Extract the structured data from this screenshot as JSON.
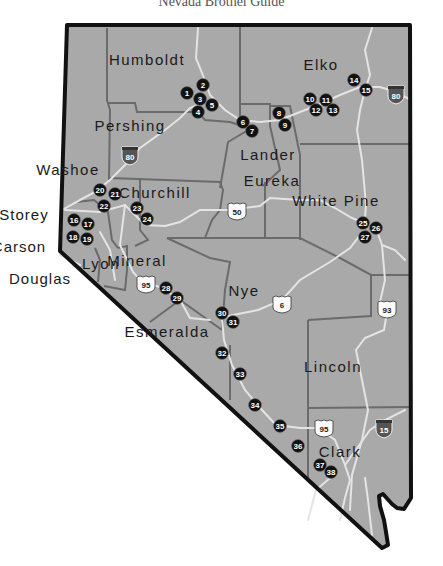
{
  "title": "Nevada Brothel Guide",
  "colors": {
    "land": "#a9a9a9",
    "outline": "#111111",
    "county_border": "#6b6b6b",
    "road": "#e4e4e4",
    "marker": "#111111"
  },
  "counties": [
    {
      "name": "Humboldt",
      "x": 147,
      "y": 65
    },
    {
      "name": "Elko",
      "x": 321,
      "y": 70
    },
    {
      "name": "Pershing",
      "x": 130,
      "y": 131
    },
    {
      "name": "Lander",
      "x": 268,
      "y": 160
    },
    {
      "name": "Washoe",
      "x": 68,
      "y": 175
    },
    {
      "name": "Churchill",
      "x": 155,
      "y": 198
    },
    {
      "name": "Eureka",
      "x": 272,
      "y": 186
    },
    {
      "name": "White Pine",
      "x": 336,
      "y": 206
    },
    {
      "name": "Lyon",
      "x": 101,
      "y": 269
    },
    {
      "name": "Mineral",
      "x": 137,
      "y": 266
    },
    {
      "name": "Nye",
      "x": 244,
      "y": 296
    },
    {
      "name": "Esmeralda",
      "x": 167,
      "y": 337
    },
    {
      "name": "Lincoln",
      "x": 333,
      "y": 372
    },
    {
      "name": "Clark",
      "x": 340,
      "y": 457
    }
  ],
  "external_labels": [
    {
      "name": "Storey",
      "x": 24,
      "y": 220
    },
    {
      "name": "Carson",
      "x": 19,
      "y": 252
    },
    {
      "name": "Douglas",
      "x": 40,
      "y": 284
    }
  ],
  "highways": [
    {
      "type": "interstate",
      "number": "80",
      "x": 130,
      "y": 155
    },
    {
      "type": "interstate",
      "number": "80",
      "x": 396,
      "y": 94
    },
    {
      "type": "us",
      "number": "50",
      "x": 237,
      "y": 211
    },
    {
      "type": "us",
      "number": "95",
      "x": 146,
      "y": 284
    },
    {
      "type": "us",
      "number": "6",
      "x": 282,
      "y": 304
    },
    {
      "type": "us",
      "number": "93",
      "x": 387,
      "y": 309
    },
    {
      "type": "us",
      "number": "95",
      "x": 324,
      "y": 428
    },
    {
      "type": "interstate",
      "number": "15",
      "x": 384,
      "y": 428
    }
  ],
  "markers": [
    {
      "n": "1",
      "x": 187,
      "y": 93
    },
    {
      "n": "2",
      "x": 203,
      "y": 85
    },
    {
      "n": "3",
      "x": 200,
      "y": 99
    },
    {
      "n": "4",
      "x": 198,
      "y": 112
    },
    {
      "n": "5",
      "x": 212,
      "y": 105
    },
    {
      "n": "6",
      "x": 243,
      "y": 122
    },
    {
      "n": "7",
      "x": 252,
      "y": 131
    },
    {
      "n": "8",
      "x": 279,
      "y": 113
    },
    {
      "n": "9",
      "x": 285,
      "y": 125
    },
    {
      "n": "10",
      "x": 310,
      "y": 99
    },
    {
      "n": "11",
      "x": 326,
      "y": 100
    },
    {
      "n": "12",
      "x": 316,
      "y": 110
    },
    {
      "n": "13",
      "x": 333,
      "y": 110
    },
    {
      "n": "14",
      "x": 354,
      "y": 80
    },
    {
      "n": "15",
      "x": 366,
      "y": 90
    },
    {
      "n": "16",
      "x": 74,
      "y": 220
    },
    {
      "n": "17",
      "x": 88,
      "y": 224
    },
    {
      "n": "18",
      "x": 73,
      "y": 237
    },
    {
      "n": "19",
      "x": 87,
      "y": 239
    },
    {
      "n": "20",
      "x": 100,
      "y": 190
    },
    {
      "n": "21",
      "x": 115,
      "y": 194
    },
    {
      "n": "22",
      "x": 104,
      "y": 206
    },
    {
      "n": "23",
      "x": 137,
      "y": 208
    },
    {
      "n": "24",
      "x": 147,
      "y": 219
    },
    {
      "n": "25",
      "x": 363,
      "y": 223
    },
    {
      "n": "26",
      "x": 376,
      "y": 228
    },
    {
      "n": "27",
      "x": 365,
      "y": 237
    },
    {
      "n": "28",
      "x": 166,
      "y": 288
    },
    {
      "n": "29",
      "x": 177,
      "y": 298
    },
    {
      "n": "30",
      "x": 222,
      "y": 313
    },
    {
      "n": "31",
      "x": 233,
      "y": 322
    },
    {
      "n": "32",
      "x": 222,
      "y": 353
    },
    {
      "n": "33",
      "x": 240,
      "y": 374
    },
    {
      "n": "34",
      "x": 255,
      "y": 405
    },
    {
      "n": "35",
      "x": 280,
      "y": 426
    },
    {
      "n": "36",
      "x": 298,
      "y": 446
    },
    {
      "n": "37",
      "x": 320,
      "y": 465
    },
    {
      "n": "38",
      "x": 331,
      "y": 472
    }
  ]
}
